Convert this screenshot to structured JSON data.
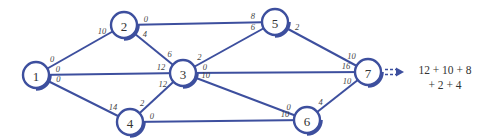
{
  "diagram": {
    "colors": {
      "edge": "#3d4f9e",
      "node_stroke": "#3d4f9e",
      "text": "#333333"
    },
    "nodes": [
      {
        "id": "1",
        "label": "1"
      },
      {
        "id": "2",
        "label": "2"
      },
      {
        "id": "3",
        "label": "3"
      },
      {
        "id": "4",
        "label": "4"
      },
      {
        "id": "5",
        "label": "5"
      },
      {
        "id": "6",
        "label": "6"
      },
      {
        "id": "7",
        "label": "7"
      }
    ],
    "edges": [
      {
        "from": "1",
        "to": "2",
        "from_label": "0",
        "to_label": "10"
      },
      {
        "from": "1",
        "to": "3",
        "from_label": "0",
        "to_label": "12"
      },
      {
        "from": "1",
        "to": "4",
        "from_label": "0",
        "to_label": "14"
      },
      {
        "from": "2",
        "to": "5",
        "from_label": "0",
        "to_label": "8"
      },
      {
        "from": "2",
        "to": "3",
        "from_label": "4",
        "to_label": "6"
      },
      {
        "from": "4",
        "to": "3",
        "from_label": "2",
        "to_label": "12"
      },
      {
        "from": "3",
        "to": "5",
        "from_label": "2",
        "to_label": "6"
      },
      {
        "from": "3",
        "to": "7",
        "from_label": "0",
        "to_label": "16"
      },
      {
        "from": "3",
        "to": "6",
        "from_label": "10",
        "to_label": "0"
      },
      {
        "from": "4",
        "to": "6",
        "from_label": "0",
        "to_label": "10"
      },
      {
        "from": "5",
        "to": "7",
        "from_label": "2",
        "to_label": "10"
      },
      {
        "from": "6",
        "to": "7",
        "from_label": "4",
        "to_label": "10"
      }
    ],
    "output_arrow": "double-dashed-arrow",
    "formula": {
      "line1": "12 + 10 + 8",
      "line2": "+ 2 + 4"
    }
  }
}
